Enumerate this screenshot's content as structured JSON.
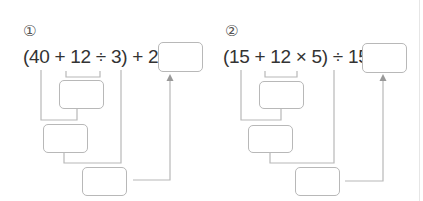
{
  "problems": [
    {
      "number": "①",
      "expression": "(40 + 12 ÷ 3) + 26 =",
      "answer_box": "",
      "steps": [
        "",
        "",
        ""
      ]
    },
    {
      "number": "②",
      "expression": "(15 + 12 × 5) ÷ 15 =",
      "answer_box": "",
      "steps": [
        "",
        "",
        ""
      ]
    }
  ],
  "colors": {
    "text": "#333333",
    "line": "#b8b8b8",
    "box_border": "#b8b8b8",
    "divider": "#e6e6e6"
  }
}
